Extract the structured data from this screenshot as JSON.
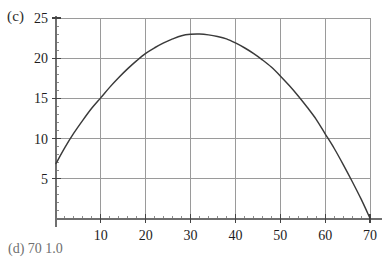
{
  "panel": {
    "label": "(c)",
    "next_label": "(d)   70  1.0"
  },
  "chart_data": {
    "type": "line",
    "title": "",
    "subtitle": "",
    "xlabel": "",
    "ylabel": "",
    "xlim": [
      0,
      71.5
    ],
    "ylim": [
      0,
      25.6
    ],
    "grid": true,
    "legend_position": "none",
    "xticks": [
      10,
      20,
      30,
      40,
      50,
      60,
      70
    ],
    "xtick_labels": [
      "10",
      "20",
      "30",
      "40",
      "50",
      "60",
      "70"
    ],
    "yticks": [
      5,
      10,
      15,
      20,
      25
    ],
    "ytick_labels": [
      "5",
      "10",
      "15",
      "20",
      "25"
    ],
    "minor_tick_step_x": 2,
    "minor_tick_step_y": 1,
    "line_color": "#3a3a3a",
    "grid_color": "#9a9a9a",
    "axis_color": "#6f6f6f",
    "series": [
      {
        "name": "curve",
        "x": [
          0,
          2,
          4,
          6,
          8,
          10,
          12,
          14,
          16,
          18,
          20,
          22,
          24,
          26,
          28,
          30,
          32,
          34,
          36,
          38,
          40,
          42,
          44,
          46,
          48,
          50,
          52,
          54,
          56,
          58,
          60,
          62,
          64,
          66,
          68,
          70
        ],
        "values": [
          6.9,
          8.9,
          10.7,
          12.3,
          13.8,
          15.1,
          16.4,
          17.6,
          18.7,
          19.7,
          20.6,
          21.3,
          21.9,
          22.4,
          22.8,
          22.97,
          23.0,
          22.9,
          22.7,
          22.4,
          21.9,
          21.3,
          20.6,
          19.8,
          18.9,
          17.8,
          16.6,
          15.3,
          13.9,
          12.4,
          10.6,
          8.8,
          6.8,
          4.7,
          2.5,
          0.1
        ]
      }
    ],
    "annotations": [
      {
        "text": "peak",
        "x": 32,
        "y": 23.0
      },
      {
        "text": "left-endpoint",
        "x": 0,
        "y": 6.9
      },
      {
        "text": "right-endpoint",
        "x": 70,
        "y": 0.0
      }
    ]
  }
}
